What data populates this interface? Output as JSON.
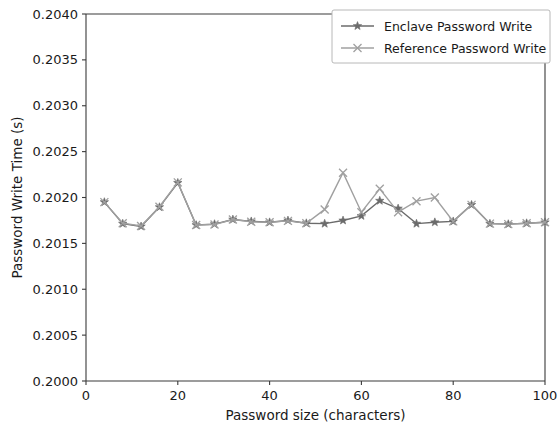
{
  "chart_data": {
    "type": "line",
    "title": "",
    "xlabel": "Password size (characters)",
    "ylabel": "Password Write Time (s)",
    "xlim": [
      0,
      100
    ],
    "ylim": [
      0.2,
      0.204
    ],
    "xticks": [
      0,
      20,
      40,
      60,
      80,
      100
    ],
    "yticks": [
      0.2,
      0.2005,
      0.201,
      0.2015,
      0.202,
      0.2025,
      0.203,
      0.2035,
      0.204
    ],
    "xtick_labels": [
      "0",
      "20",
      "40",
      "60",
      "80",
      "100"
    ],
    "ytick_labels": [
      "0.2000",
      "0.2005",
      "0.2010",
      "0.2015",
      "0.2020",
      "0.2025",
      "0.2030",
      "0.2035",
      "0.2040"
    ],
    "grid": false,
    "legend_position": "upper right",
    "x": [
      4,
      8,
      12,
      16,
      20,
      24,
      28,
      32,
      36,
      40,
      44,
      48,
      52,
      56,
      60,
      64,
      68,
      72,
      76,
      80,
      84,
      88,
      92,
      96,
      100
    ],
    "series": [
      {
        "name": "Enclave Password Write",
        "marker": "star",
        "color": "#6b6b6b",
        "values": [
          0.20195,
          0.201715,
          0.201685,
          0.201895,
          0.20216,
          0.2017,
          0.20171,
          0.20176,
          0.20174,
          0.20173,
          0.20175,
          0.20172,
          0.201715,
          0.20175,
          0.2018,
          0.201965,
          0.20188,
          0.201715,
          0.20173,
          0.20174,
          0.20192,
          0.201715,
          0.20171,
          0.20172,
          0.20173
        ]
      },
      {
        "name": "Reference Password Write",
        "marker": "x",
        "color": "#a0a0a0",
        "values": [
          0.20195,
          0.20172,
          0.20169,
          0.2019,
          0.202165,
          0.2017,
          0.201705,
          0.20176,
          0.201735,
          0.20173,
          0.201745,
          0.20172,
          0.20187,
          0.20227,
          0.20184,
          0.202095,
          0.20184,
          0.20196,
          0.202,
          0.20174,
          0.20192,
          0.201715,
          0.20171,
          0.20172,
          0.20173
        ]
      }
    ]
  },
  "legend": {
    "entries": [
      {
        "label": "Enclave Password Write"
      },
      {
        "label": "Reference Password Write"
      }
    ]
  },
  "colors": {
    "enclave": "#6b6b6b",
    "reference": "#a0a0a0",
    "axis": "#3a3a3a",
    "text": "#1a1a1a",
    "background": "#ffffff"
  }
}
